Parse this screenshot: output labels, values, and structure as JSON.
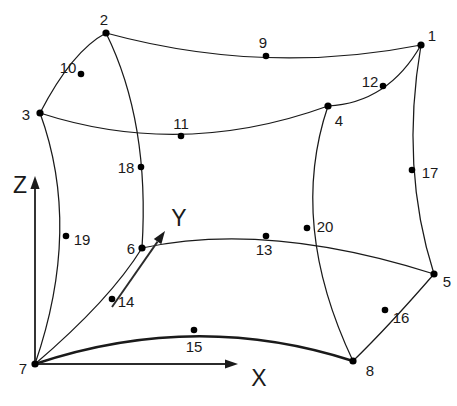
{
  "figure": {
    "width": 457,
    "height": 406,
    "background_color": "#ffffff",
    "line_color": "#1a1a1a",
    "node_color": "#000000"
  },
  "axes": [
    {
      "name": "Z",
      "label": "Z",
      "label_x": 20,
      "label_y": 185,
      "origin_x": 35,
      "origin_y": 364,
      "tip_x": 35,
      "tip_y": 176
    },
    {
      "name": "Y",
      "label": "Y",
      "label_x": 179,
      "label_y": 218,
      "origin_x": 112,
      "origin_y": 307,
      "tip_x": 165,
      "tip_y": 231
    },
    {
      "name": "X",
      "label": "X",
      "label_x": 259,
      "label_y": 378,
      "origin_x": 35,
      "origin_y": 364,
      "tip_x": 238,
      "tip_y": 364
    }
  ],
  "nodes": [
    {
      "id": "1",
      "x": 421,
      "y": 45,
      "label_x": 432,
      "label_y": 35,
      "kind": "corner"
    },
    {
      "id": "2",
      "x": 106,
      "y": 33,
      "label_x": 104,
      "label_y": 19,
      "kind": "corner"
    },
    {
      "id": "3",
      "x": 40,
      "y": 113,
      "label_x": 26,
      "label_y": 114,
      "kind": "corner"
    },
    {
      "id": "4",
      "x": 328,
      "y": 106,
      "label_x": 339,
      "label_y": 120,
      "kind": "corner"
    },
    {
      "id": "5",
      "x": 434,
      "y": 274,
      "label_x": 447,
      "label_y": 281,
      "kind": "corner"
    },
    {
      "id": "6",
      "x": 142,
      "y": 248,
      "label_x": 131,
      "label_y": 248,
      "kind": "corner"
    },
    {
      "id": "7",
      "x": 35,
      "y": 364,
      "label_x": 23,
      "label_y": 368,
      "kind": "corner"
    },
    {
      "id": "8",
      "x": 353,
      "y": 361,
      "label_x": 370,
      "label_y": 370,
      "kind": "corner"
    },
    {
      "id": "9",
      "x": 266,
      "y": 56,
      "label_x": 263,
      "label_y": 42,
      "kind": "midside"
    },
    {
      "id": "10",
      "x": 81,
      "y": 74,
      "label_x": 68,
      "label_y": 67,
      "kind": "midside"
    },
    {
      "id": "11",
      "x": 181,
      "y": 136,
      "label_x": 181,
      "label_y": 123,
      "kind": "midside"
    },
    {
      "id": "12",
      "x": 383,
      "y": 86,
      "label_x": 370,
      "label_y": 81,
      "kind": "midside"
    },
    {
      "id": "13",
      "x": 266,
      "y": 236,
      "label_x": 264,
      "label_y": 249,
      "kind": "midside"
    },
    {
      "id": "14",
      "x": 112,
      "y": 299,
      "label_x": 126,
      "label_y": 301,
      "kind": "midside"
    },
    {
      "id": "15",
      "x": 194,
      "y": 330,
      "label_x": 194,
      "label_y": 346,
      "kind": "midside"
    },
    {
      "id": "16",
      "x": 385,
      "y": 310,
      "label_x": 401,
      "label_y": 317,
      "kind": "midside"
    },
    {
      "id": "17",
      "x": 412,
      "y": 170,
      "label_x": 430,
      "label_y": 172,
      "kind": "midside"
    },
    {
      "id": "18",
      "x": 141,
      "y": 167,
      "label_x": 126,
      "label_y": 167,
      "kind": "midside"
    },
    {
      "id": "19",
      "x": 66,
      "y": 236,
      "label_x": 82,
      "label_y": 239,
      "kind": "midside"
    },
    {
      "id": "20",
      "x": 307,
      "y": 228,
      "label_x": 325,
      "label_y": 226,
      "kind": "midside"
    }
  ],
  "edges": [
    {
      "name": "edge-2-9-1",
      "from": "2",
      "mid": "9",
      "to": "1",
      "path": "M 106,33 Q 264,76 421,45",
      "bold": false
    },
    {
      "name": "edge-2-10-3",
      "from": "2",
      "mid": "10",
      "to": "3",
      "path": "M 106,33 Q 72,51 40,113",
      "bold": false
    },
    {
      "name": "edge-3-11-4",
      "from": "3",
      "mid": "11",
      "to": "4",
      "path": "M 40,113 Q 182,159 328,106",
      "bold": false
    },
    {
      "name": "edge-4-12-1",
      "from": "4",
      "mid": "12",
      "to": "1",
      "path": "M 328,106 Q 388,103 421,45",
      "bold": false
    },
    {
      "name": "edge-2-18-6",
      "from": "2",
      "mid": "18",
      "to": "6",
      "path": "M 106,33 Q 150,122 142,248",
      "bold": false
    },
    {
      "name": "edge-3-19-7",
      "from": "3",
      "mid": "19",
      "to": "7",
      "path": "M 40,113 Q 82,228 35,364",
      "bold": false
    },
    {
      "name": "edge-1-17-5",
      "from": "1",
      "mid": "17",
      "to": "5",
      "path": "M 421,45 Q 400,168 434,274",
      "bold": false
    },
    {
      "name": "edge-4-20-8",
      "from": "4",
      "mid": "20",
      "to": "8",
      "path": "M 328,106 Q 288,224 353,361",
      "bold": false
    },
    {
      "name": "edge-6-13-5",
      "from": "6",
      "mid": "13",
      "to": "5",
      "path": "M 142,248 Q 268,221 434,274",
      "bold": false
    },
    {
      "name": "edge-6-14-7",
      "from": "6",
      "mid": "14",
      "to": "7",
      "path": "M 142,248 Q 110,300 35,364",
      "bold": false
    },
    {
      "name": "edge-7-15-8",
      "from": "7",
      "mid": "15",
      "to": "8",
      "path": "M 35,364 Q 196,310 353,361",
      "bold": true
    },
    {
      "name": "edge-8-16-5",
      "from": "8",
      "mid": "16",
      "to": "5",
      "path": "M 353,361 Q 388,327 434,274",
      "bold": false
    }
  ],
  "caption": {
    "text": ""
  }
}
